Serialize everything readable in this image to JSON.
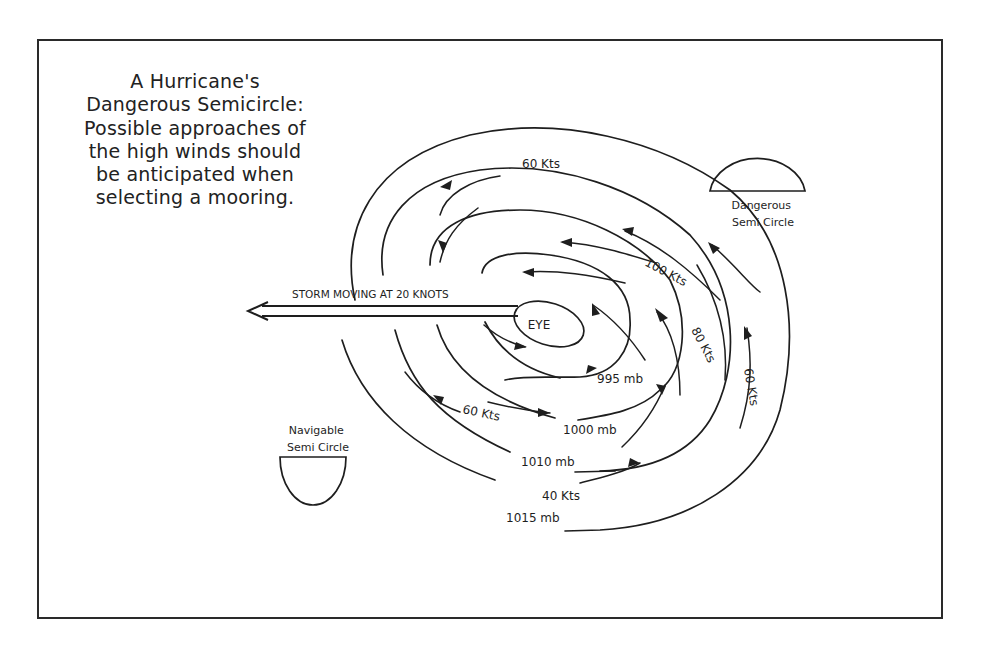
{
  "title_lines": [
    "A Hurricane's",
    "Dangerous Semicircle:",
    "Possible approaches of",
    "the high winds should",
    "be anticipated when",
    "selecting a mooring."
  ],
  "storm_motion": {
    "label": "STORM MOVING AT 20 KNOTS",
    "direction": "west"
  },
  "eye_label": "EYE",
  "semicircles": {
    "dangerous": "Dangerous Semi Circle",
    "dangerous_lines": [
      "Dangerous",
      "Semi Circle"
    ],
    "navigable": "Navigable Semi Circle",
    "navigable_lines": [
      "Navigable",
      "Semi Circle"
    ]
  },
  "isobars": [
    {
      "label": "995 mb"
    },
    {
      "label": "1000 mb"
    },
    {
      "label": "1010 mb"
    },
    {
      "label": "1015 mb"
    }
  ],
  "wind_speeds": [
    {
      "label": "100 Kts"
    },
    {
      "label": "80 Kts"
    },
    {
      "label": "60 Kts",
      "position": "top"
    },
    {
      "label": "60 Kts",
      "position": "right"
    },
    {
      "label": "60 Kts",
      "position": "lower-left"
    },
    {
      "label": "40 Kts"
    }
  ],
  "colors": {
    "ink": "#1e1e1e",
    "background": "#ffffff"
  }
}
